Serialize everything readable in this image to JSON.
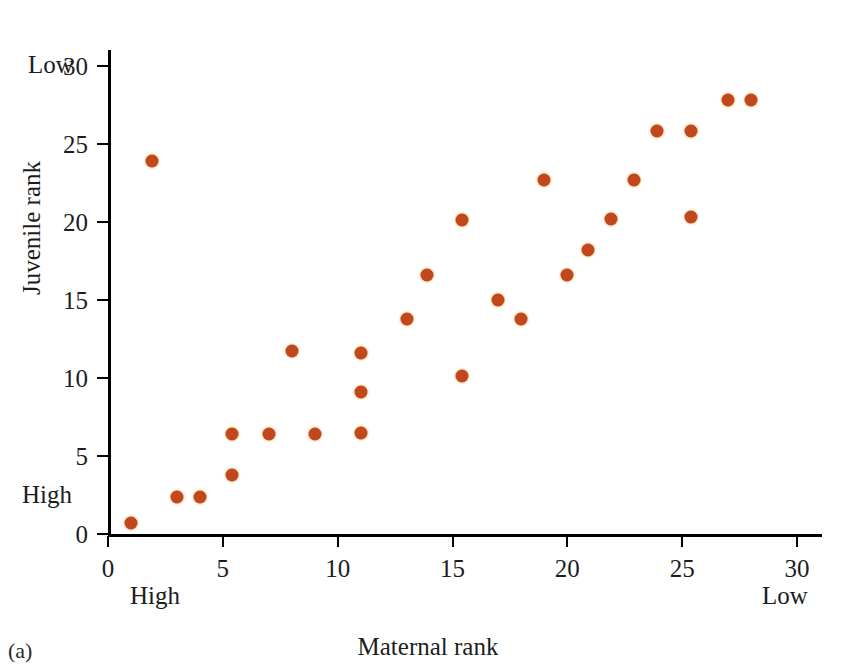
{
  "figure": {
    "panel_caption": "(a)",
    "x_axis_title": "Maternal rank",
    "y_axis_title": "Juvenile rank",
    "x_end_labels": {
      "left": "High",
      "right": "Low"
    },
    "y_end_labels": {
      "bottom": "High",
      "top": "Low"
    },
    "marker_color": "#c0481c",
    "axis_color": "#000000",
    "background_color": "#ffffff"
  },
  "chart_data": {
    "type": "scatter",
    "title": "",
    "xlabel": "Maternal rank",
    "ylabel": "Juvenile rank",
    "xlim": [
      0,
      31
    ],
    "ylim": [
      0,
      31
    ],
    "xticks": [
      0,
      5,
      10,
      15,
      20,
      25,
      30
    ],
    "xticklabels": [
      "0",
      "5",
      "10",
      "15",
      "20",
      "25",
      "30"
    ],
    "yticks": [
      0,
      5,
      10,
      15,
      20,
      25,
      30
    ],
    "yticklabels": [
      "0",
      "5",
      "10",
      "15",
      "20",
      "25",
      "30"
    ],
    "grid": false,
    "legend": false,
    "annotations": [
      {
        "text": "High",
        "axis": "x",
        "position": "left"
      },
      {
        "text": "Low",
        "axis": "x",
        "position": "right"
      },
      {
        "text": "High",
        "axis": "y",
        "position": "bottom"
      },
      {
        "text": "Low",
        "axis": "y",
        "position": "top"
      },
      {
        "text": "(a)",
        "axis": "figure",
        "position": "bottom-left"
      }
    ],
    "series": [
      {
        "name": "juvenile rank vs maternal rank",
        "color": "#c0481c",
        "marker": "circle",
        "points": [
          [
            1.0,
            0.7
          ],
          [
            1.9,
            23.9
          ],
          [
            3.0,
            2.4
          ],
          [
            4.0,
            2.4
          ],
          [
            5.4,
            3.8
          ],
          [
            5.4,
            6.4
          ],
          [
            7.0,
            6.4
          ],
          [
            8.0,
            11.7
          ],
          [
            9.0,
            6.4
          ],
          [
            11.0,
            6.5
          ],
          [
            11.0,
            9.1
          ],
          [
            11.0,
            11.6
          ],
          [
            13.0,
            13.8
          ],
          [
            13.9,
            16.6
          ],
          [
            15.4,
            10.1
          ],
          [
            15.4,
            20.1
          ],
          [
            17.0,
            15.0
          ],
          [
            18.0,
            13.8
          ],
          [
            19.0,
            22.7
          ],
          [
            20.0,
            16.6
          ],
          [
            20.9,
            18.2
          ],
          [
            21.9,
            20.2
          ],
          [
            22.9,
            22.7
          ],
          [
            23.9,
            25.8
          ],
          [
            25.4,
            20.3
          ],
          [
            25.4,
            25.8
          ],
          [
            27.0,
            27.8
          ],
          [
            28.0,
            27.8
          ]
        ]
      }
    ]
  }
}
